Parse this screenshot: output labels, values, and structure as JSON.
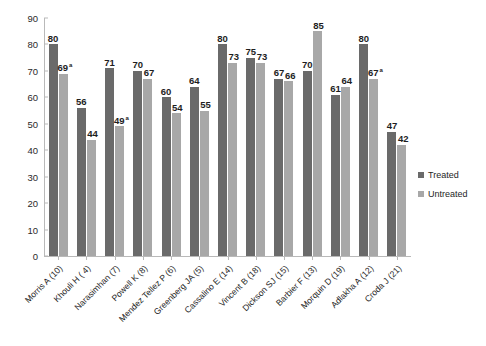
{
  "chart_data": {
    "type": "bar",
    "title": "",
    "subtitle": "",
    "xlabel": "",
    "ylabel": "",
    "ylim": [
      0,
      90
    ],
    "yticks": [
      0,
      10,
      20,
      30,
      40,
      50,
      60,
      70,
      80,
      90
    ],
    "grid": false,
    "legend_position": "right",
    "categories": [
      "Morris A (10)",
      "Khouli H ( 4)",
      "Narasimhan (7)",
      "Powell K (8)",
      "Mendez Tellez P (6)",
      "Greenberg JA (5)",
      "Cassalino E (14)",
      "Vincent B (18)",
      "Dickson SJ (15)",
      "Barbier F (13)",
      "Morquin D (19)",
      "Adlakha A (12)",
      "Croda J (21)"
    ],
    "series": [
      {
        "name": "Treated",
        "color": "#6a6a6a",
        "values": [
          80,
          56,
          71,
          70,
          60,
          64,
          80,
          75,
          67,
          70,
          61,
          80,
          47
        ],
        "labels": [
          "80",
          "56",
          "71",
          "70",
          "60",
          "64",
          "80",
          "75",
          "67",
          "70",
          "61",
          "80",
          "47"
        ],
        "label_marks": [
          "",
          "",
          "",
          "",
          "",
          "",
          "",
          "",
          "",
          "",
          "",
          "",
          ""
        ]
      },
      {
        "name": "Untreated",
        "color": "#a8a8a8",
        "values": [
          69,
          44,
          49,
          67,
          54,
          55,
          73,
          73,
          66,
          85,
          64,
          67,
          42
        ],
        "labels": [
          "69",
          "44",
          "49",
          "67",
          "54",
          "55",
          "73",
          "73",
          "66",
          "85",
          "64",
          "67",
          "42"
        ],
        "label_marks": [
          "a",
          "",
          "a",
          "",
          "",
          "",
          "",
          "",
          "",
          "",
          "",
          "a",
          ""
        ]
      }
    ]
  },
  "legend": {
    "items": [
      {
        "label": "Treated",
        "color": "#6a6a6a"
      },
      {
        "label": "Untreated",
        "color": "#a8a8a8"
      }
    ]
  }
}
